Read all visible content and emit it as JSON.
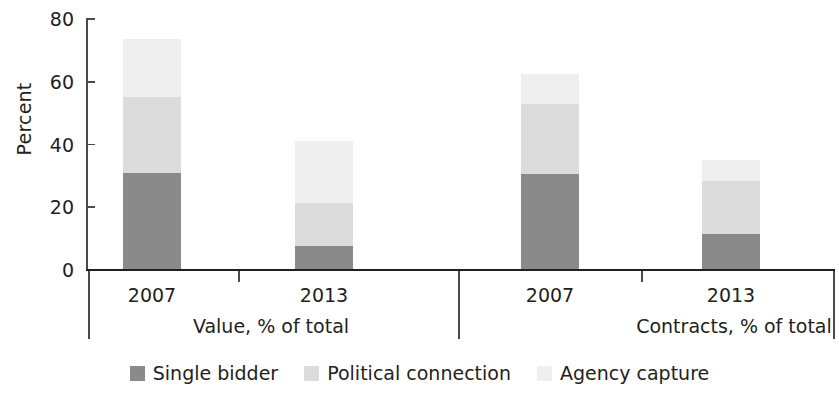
{
  "chart_data": {
    "type": "bar",
    "subtype": "stacked-bar",
    "title": "",
    "xlabel": "",
    "ylabel": "Percent",
    "ylim": [
      0,
      80
    ],
    "yticks": [
      0,
      20,
      40,
      60,
      80
    ],
    "ytick_labels": [
      "0",
      "20",
      "40",
      "60",
      "80"
    ],
    "grid": false,
    "legend_position": "bottom",
    "categories": [
      "2007",
      "2013",
      "2007",
      "2013"
    ],
    "groups": [
      {
        "label": "Value, % of total",
        "categories": [
          "2007",
          "2013"
        ]
      },
      {
        "label": "Contracts, % of total",
        "categories": [
          "2007",
          "2013"
        ]
      }
    ],
    "series": [
      {
        "name": "Single bidder",
        "color": "#8a8a8a",
        "values": [
          31,
          7.5,
          30.5,
          11.5
        ]
      },
      {
        "name": "Political connection",
        "color": "#dcdcdc",
        "values": [
          24,
          14,
          22.5,
          17
        ]
      },
      {
        "name": "Agency capture",
        "color": "#efefef",
        "values": [
          18.5,
          19.5,
          9.5,
          6.5
        ]
      }
    ],
    "stack_totals": [
      73.5,
      41,
      62.5,
      35
    ]
  },
  "axis": {
    "y_title": "Percent",
    "ticks": [
      {
        "label": "80",
        "value": 80
      },
      {
        "label": "60",
        "value": 60
      },
      {
        "label": "40",
        "value": 40
      },
      {
        "label": "20",
        "value": 20
      },
      {
        "label": "0",
        "value": 0
      }
    ]
  },
  "bars": [
    {
      "category": "2007",
      "group": "Value, % of total",
      "segments": [
        {
          "series": "Single bidder",
          "value": 31
        },
        {
          "series": "Political connection",
          "value": 24
        },
        {
          "series": "Agency capture",
          "value": 18.5
        }
      ]
    },
    {
      "category": "2013",
      "group": "Value, % of total",
      "segments": [
        {
          "series": "Single bidder",
          "value": 7.5
        },
        {
          "series": "Political connection",
          "value": 14
        },
        {
          "series": "Agency capture",
          "value": 19.5
        }
      ]
    },
    {
      "category": "2007",
      "group": "Contracts, % of total",
      "segments": [
        {
          "series": "Single bidder",
          "value": 30.5
        },
        {
          "series": "Political connection",
          "value": 22.5
        },
        {
          "series": "Agency capture",
          "value": 9.5
        }
      ]
    },
    {
      "category": "2013",
      "group": "Contracts, % of total",
      "segments": [
        {
          "series": "Single bidder",
          "value": 11.5
        },
        {
          "series": "Political connection",
          "value": 17
        },
        {
          "series": "Agency capture",
          "value": 6.5
        }
      ]
    }
  ],
  "category_labels": [
    "2007",
    "2013",
    "2007",
    "2013"
  ],
  "group_labels": [
    "Value, % of total",
    "Contracts, % of total"
  ],
  "legend": {
    "items": [
      {
        "label": "Single bidder",
        "color": "#8a8a8a"
      },
      {
        "label": "Political connection",
        "color": "#dcdcdc"
      },
      {
        "label": "Agency capture",
        "color": "#efefef"
      }
    ]
  },
  "colors": {
    "single_bidder": "#8a8a8a",
    "political_connection": "#dcdcdc",
    "agency_capture": "#efefef",
    "axis": "#4a4a4a",
    "text": "#231f20",
    "background": "#ffffff"
  }
}
